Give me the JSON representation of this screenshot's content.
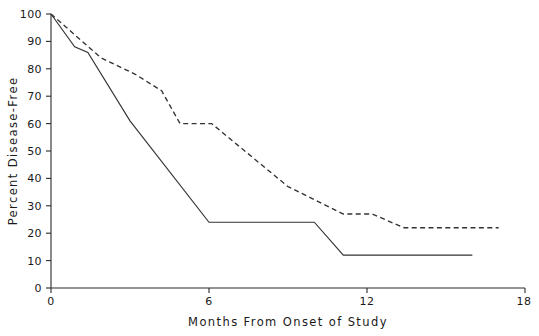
{
  "chart_data": {
    "type": "line",
    "title": "",
    "xlabel": "Months From Onset of Study",
    "ylabel": "Percent Disease-Free",
    "xlim": [
      0,
      18
    ],
    "ylim": [
      0,
      100
    ],
    "grid": false,
    "legend": "none",
    "x_ticks": [
      0,
      6,
      12,
      18
    ],
    "x_tick_labels": [
      "0",
      "6",
      "12",
      "18"
    ],
    "y_ticks": [
      0,
      10,
      20,
      30,
      40,
      50,
      60,
      70,
      80,
      90,
      100
    ],
    "y_tick_labels": [
      "0",
      "10",
      "20",
      "30",
      "40",
      "50",
      "60",
      "70",
      "80",
      "90",
      "100"
    ],
    "series": [
      {
        "name": "solid-curve",
        "style": "solid",
        "color": "#333333",
        "points": [
          [
            0.0,
            100
          ],
          [
            0.9,
            88
          ],
          [
            1.4,
            86
          ],
          [
            3.0,
            61
          ],
          [
            6.0,
            24
          ],
          [
            10.0,
            24
          ],
          [
            11.1,
            12
          ],
          [
            16.0,
            12
          ]
        ]
      },
      {
        "name": "dashed-curve",
        "style": "dashed",
        "color": "#333333",
        "points": [
          [
            0.0,
            100
          ],
          [
            1.9,
            84
          ],
          [
            3.2,
            78
          ],
          [
            4.2,
            72
          ],
          [
            4.9,
            60
          ],
          [
            6.1,
            60
          ],
          [
            9.0,
            37
          ],
          [
            11.1,
            27
          ],
          [
            12.2,
            27
          ],
          [
            13.4,
            22
          ],
          [
            17.0,
            22
          ]
        ]
      }
    ]
  },
  "geometry": {
    "plot_left": 51,
    "plot_right": 525,
    "plot_bottom": 288,
    "plot_top": 14,
    "x_axis_label_y": 322,
    "y_axis_label_x": 17
  }
}
